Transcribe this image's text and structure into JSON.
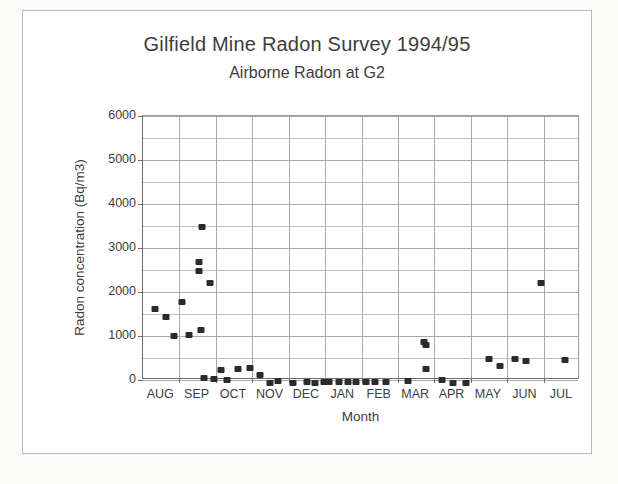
{
  "chart_data": {
    "type": "scatter",
    "title": "Gilfield Mine Radon Survey 1994/95",
    "subtitle": "Airborne Radon at G2",
    "xlabel": "Month",
    "ylabel": "Radon concentration  (Bq/m3)",
    "ylim": [
      0,
      6000
    ],
    "ytick_labels": [
      "0",
      "1000",
      "2000",
      "3000",
      "4000",
      "5000",
      "6000"
    ],
    "ytick_values": [
      0,
      1000,
      2000,
      3000,
      4000,
      5000,
      6000
    ],
    "grid": "horizontal-major-and-minor, vertical-at-month-boundaries",
    "legend": "none",
    "categories": [
      "AUG",
      "SEP",
      "OCT",
      "NOV",
      "DEC",
      "JAN",
      "FEB",
      "MAR",
      "APR",
      "MAY",
      "JUN",
      "JUL"
    ],
    "x_axis_note": "Monthly tick boundaries; points plotted at survey dates within each month",
    "series": [
      {
        "name": "Airborne Radon at G2",
        "marker": "filled-square",
        "color": "#2b2b2b",
        "points": [
          {
            "month": "AUG",
            "frac": 0.34,
            "value": 1680
          },
          {
            "month": "AUG",
            "frac": 0.62,
            "value": 1500
          },
          {
            "month": "AUG",
            "frac": 0.86,
            "value": 1070
          },
          {
            "month": "AUG",
            "frac": 1.06,
            "value": 1840
          },
          {
            "month": "SEP",
            "frac": 0.25,
            "value": 1100
          },
          {
            "month": "SEP",
            "frac": 0.62,
            "value": 3540
          },
          {
            "month": "SEP",
            "frac": 0.55,
            "value": 2760
          },
          {
            "month": "SEP",
            "frac": 0.55,
            "value": 2550
          },
          {
            "month": "SEP",
            "frac": 0.6,
            "value": 1210
          },
          {
            "month": "SEP",
            "frac": 0.85,
            "value": 2270
          },
          {
            "month": "SEP",
            "frac": 0.68,
            "value": 120
          },
          {
            "month": "SEP",
            "frac": 0.95,
            "value": 90
          },
          {
            "month": "SEP",
            "frac": 1.15,
            "value": 300
          },
          {
            "month": "OCT",
            "frac": 0.3,
            "value": 70
          },
          {
            "month": "OCT",
            "frac": 0.62,
            "value": 320
          },
          {
            "month": "OCT",
            "frac": 0.95,
            "value": 330
          },
          {
            "month": "NOV",
            "frac": 0.2,
            "value": 180
          },
          {
            "month": "NOV",
            "frac": 0.48,
            "value": 10
          },
          {
            "month": "NOV",
            "frac": 0.7,
            "value": 50
          },
          {
            "month": "NOV",
            "frac": 1.12,
            "value": 0
          },
          {
            "month": "DEC",
            "frac": 0.5,
            "value": 30
          },
          {
            "month": "DEC",
            "frac": 0.72,
            "value": 0
          },
          {
            "month": "DEC",
            "frac": 0.98,
            "value": 30
          },
          {
            "month": "JAN",
            "frac": 0.1,
            "value": 30
          },
          {
            "month": "JAN",
            "frac": 0.38,
            "value": 30
          },
          {
            "month": "JAN",
            "frac": 0.62,
            "value": 30
          },
          {
            "month": "JAN",
            "frac": 0.84,
            "value": 30
          },
          {
            "month": "FEB",
            "frac": 0.12,
            "value": 30
          },
          {
            "month": "FEB",
            "frac": 0.38,
            "value": 30
          },
          {
            "month": "FEB",
            "frac": 0.66,
            "value": 30
          },
          {
            "month": "MAR",
            "frac": 0.28,
            "value": 40
          },
          {
            "month": "MAR",
            "frac": 0.72,
            "value": 940
          },
          {
            "month": "MAR",
            "frac": 0.78,
            "value": 870
          },
          {
            "month": "MAR",
            "frac": 0.76,
            "value": 310
          },
          {
            "month": "APR",
            "frac": 0.2,
            "value": 70
          },
          {
            "month": "APR",
            "frac": 0.52,
            "value": 0
          },
          {
            "month": "APR",
            "frac": 0.86,
            "value": 10
          },
          {
            "month": "MAY",
            "frac": 0.5,
            "value": 540
          },
          {
            "month": "MAY",
            "frac": 0.8,
            "value": 390
          },
          {
            "month": "JUN",
            "frac": 0.22,
            "value": 540
          },
          {
            "month": "JUN",
            "frac": 0.52,
            "value": 490
          },
          {
            "month": "JUN",
            "frac": 0.92,
            "value": 2280
          },
          {
            "month": "JUL",
            "frac": 0.58,
            "value": 520
          }
        ]
      }
    ]
  }
}
